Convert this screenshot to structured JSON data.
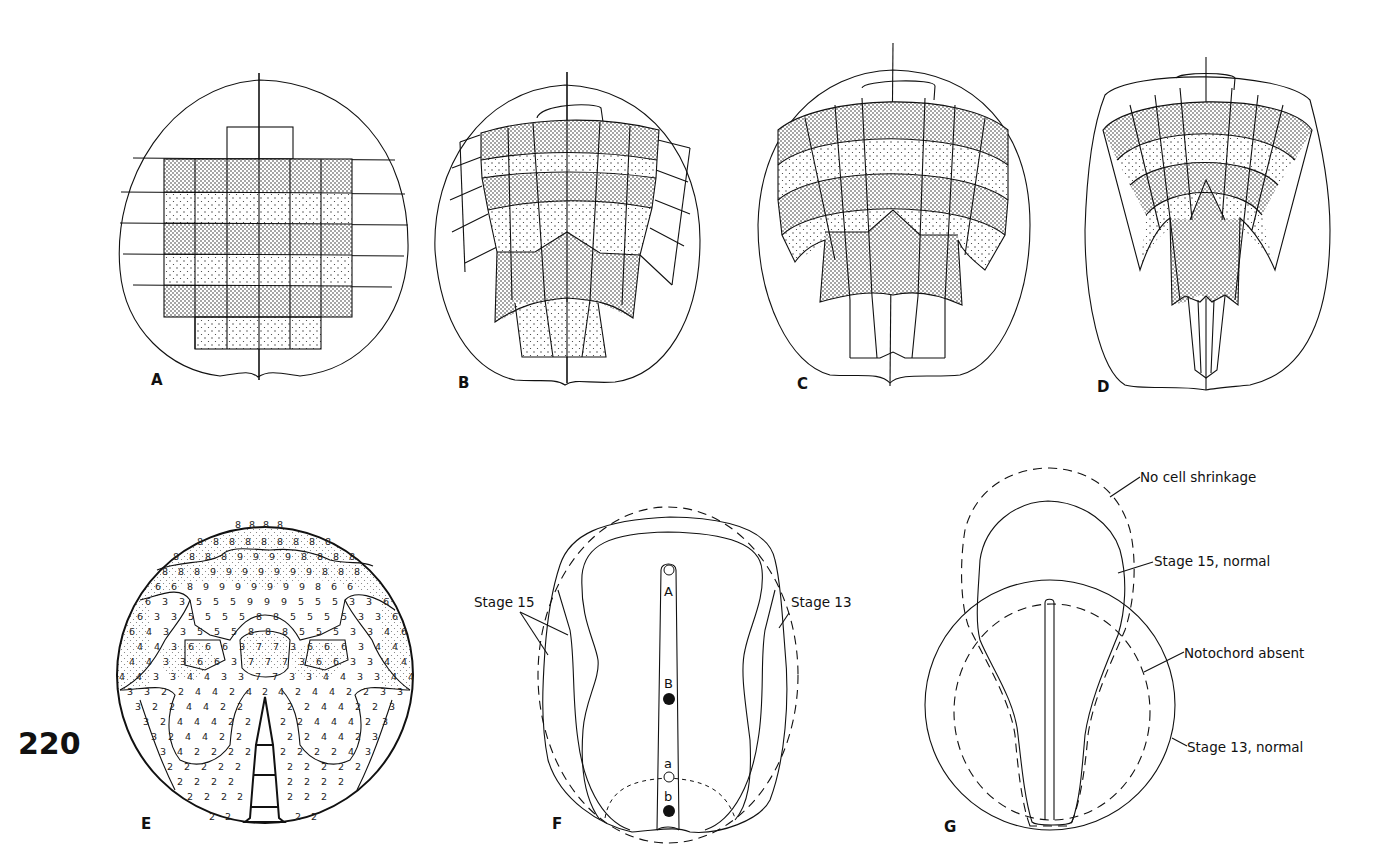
{
  "figure": {
    "page_number": "220",
    "panels": [
      {
        "id": "A",
        "label": "A"
      },
      {
        "id": "B",
        "label": "B"
      },
      {
        "id": "C",
        "label": "C"
      },
      {
        "id": "D",
        "label": "D"
      },
      {
        "id": "E",
        "label": "E"
      },
      {
        "id": "F",
        "label": "F"
      },
      {
        "id": "G",
        "label": "G"
      }
    ],
    "panel_F": {
      "annotations": {
        "stage15": "Stage 15",
        "stage13": "Stage 13"
      },
      "points": {
        "A": "A",
        "B": "B",
        "a": "a",
        "b": "b"
      }
    },
    "panel_G": {
      "annotations": {
        "no_shrinkage": "No cell shrinkage",
        "stage15_normal": "Stage 15, normal",
        "notochord_absent": "Notochord absent",
        "stage13_normal": "Stage 13, normal"
      }
    },
    "panel_E": {
      "grid_rows": [
        "8 8 8 8",
        "8 8 8 8 8 8 8 8 8",
        "8 8 8 8 9 9 9 9 8 8 8 8",
        "8 8 8 9 9 9 9 9 9 9 8 8 8",
        "6 6 8 9 9 9 9 9 9 9 8 6 6",
        "6 3 3 5 5 5 9 9 9 5 5 5 3 3 6",
        "6 3 3 5 5 5 5 8 8 5 5 5 5 3 3 6",
        "6 4 3 3 5 5 5 8 8 8 5 5 5 3 3 4 6",
        "4 4 3 6 6 6 3 7 7 3 6 6 6 3 4 4",
        "4 4 3 3 6 6 3 7 7 7 3 6 6 3 3 4 4",
        "4 4 3 3 4 4 3 3 7 7 3 3 4 4 3 3 4 4",
        "3 3 2 2 4 4 2 4 2 4 2 4 4 2 2 3 3",
        "3 2 2 4 4 2 2 2 2 2 2 4 4 2 2 3",
        "3 2 4 4 4 2 2 2 2 4 4 4 2 3",
        "3 2 4 4 2 2 2 2 2 2 4 4 2 3",
        "3 4 2 2 2 2 2 2 2 2 4 3",
        "2 2 2 2 2 2 2 2 2 2 2",
        "2 2 2 2 2 2 2 2 2",
        "2 2 2 2 2 2 2 2",
        "2 2 2 2 2 2"
      ]
    }
  }
}
